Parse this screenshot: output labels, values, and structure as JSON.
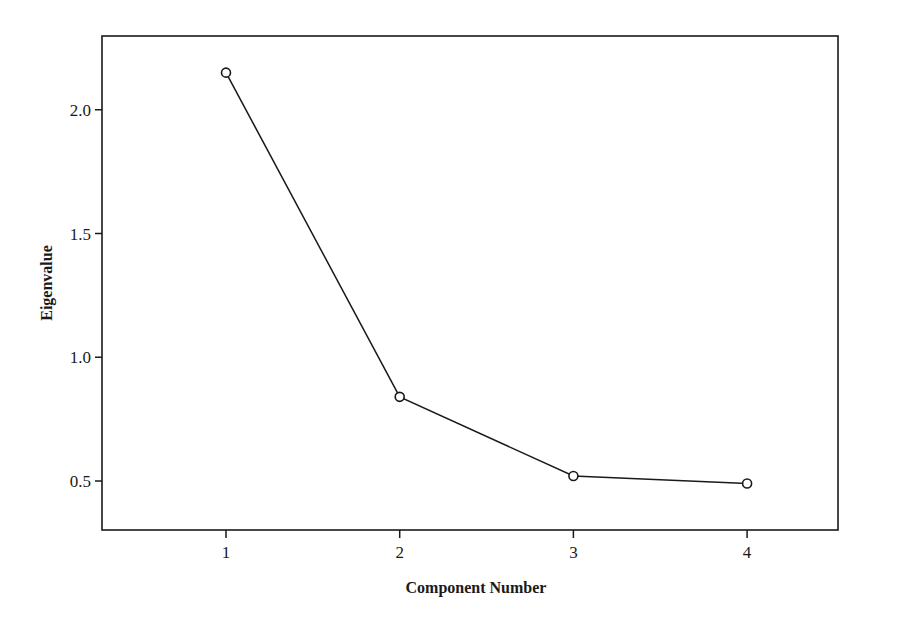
{
  "chart_data": {
    "type": "line",
    "title": "",
    "xlabel": "Component Number",
    "ylabel": "Eigenvalue",
    "categories": [
      "1",
      "2",
      "3",
      "4"
    ],
    "x": [
      1,
      2,
      3,
      4
    ],
    "series": [
      {
        "name": "Eigenvalue",
        "values": [
          2.15,
          0.84,
          0.52,
          0.49
        ],
        "marker": "open-circle",
        "color": "#1a1a1a"
      }
    ],
    "xlim": [
      0.3,
      4.65
    ],
    "ylim": [
      0.3,
      2.3
    ],
    "yticks": [
      0.5,
      1.0,
      1.5,
      2.0
    ],
    "ytick_labels": [
      "0.5",
      "1.0",
      "1.5",
      "2.0"
    ],
    "xticks": [
      1,
      2,
      3,
      4
    ],
    "xtick_labels": [
      "1",
      "2",
      "3",
      "4"
    ],
    "grid": false,
    "legend": null
  },
  "axes": {
    "x_title": "Component Number",
    "y_title": "Eigenvalue"
  }
}
